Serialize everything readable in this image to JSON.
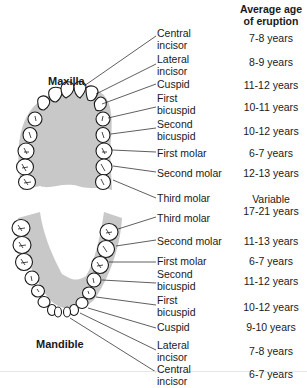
{
  "header": {
    "column_title_line1": "Average age",
    "column_title_line2": "of eruption"
  },
  "maxilla": {
    "title": "Maxilla",
    "teeth": [
      {
        "label_line1": "Central",
        "label_line2": "incisor",
        "age": "7-8 years"
      },
      {
        "label_line1": "Lateral",
        "label_line2": "incisor",
        "age": "8-9 years"
      },
      {
        "label_line1": "Cuspid",
        "label_line2": "",
        "age": "11-12 years"
      },
      {
        "label_line1": "First",
        "label_line2": "bicuspid",
        "age": "10-11 years"
      },
      {
        "label_line1": "Second",
        "label_line2": "bicuspid",
        "age": "10-12 years"
      },
      {
        "label_line1": "First molar",
        "label_line2": "",
        "age": "6-7 years"
      },
      {
        "label_line1": "Second molar",
        "label_line2": "",
        "age": "12-13 years"
      },
      {
        "label_line1": "Third molar",
        "label_line2": "",
        "age": ""
      }
    ]
  },
  "third_molar_age": {
    "line1": "Variable",
    "line2": "17-21 years"
  },
  "mandible": {
    "title": "Mandible",
    "teeth": [
      {
        "label_line1": "Third molar",
        "label_line2": "",
        "age": ""
      },
      {
        "label_line1": "Second molar",
        "label_line2": "",
        "age": "11-13 years"
      },
      {
        "label_line1": "First molar",
        "label_line2": "",
        "age": "6-7 years"
      },
      {
        "label_line1": "Second",
        "label_line2": "bicuspid",
        "age": "11-12 years"
      },
      {
        "label_line1": "First",
        "label_line2": "bicuspid",
        "age": "10-12 years"
      },
      {
        "label_line1": "Cuspid",
        "label_line2": "",
        "age": "9-10 years"
      },
      {
        "label_line1": "Lateral",
        "label_line2": "incisor",
        "age": "7-8 years"
      },
      {
        "label_line1": "Central",
        "label_line2": "incisor",
        "age": "6-7 years"
      }
    ]
  },
  "colors": {
    "gum": "#c8c8c8",
    "tooth_fill": "#ffffff",
    "outline": "#1a1a1a"
  }
}
